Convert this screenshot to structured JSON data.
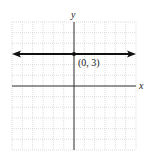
{
  "chart_data": {
    "type": "line",
    "title": "",
    "xlabel": "x",
    "ylabel": "y",
    "xlim": [
      -6,
      6
    ],
    "ylim": [
      -6,
      6
    ],
    "grid": true,
    "grid_step": 1,
    "series": [
      {
        "name": "y = 3",
        "kind": "horizontal-line",
        "x": [
          -6,
          6
        ],
        "y": [
          3,
          3
        ],
        "arrows": "both"
      }
    ],
    "points": [
      {
        "x": 0,
        "y": 3,
        "label": "(0, 3)"
      }
    ],
    "annotations": [
      "(0, 3)"
    ]
  },
  "labels": {
    "x_axis": "x",
    "y_axis": "y",
    "point": "(0, 3)"
  },
  "colors": {
    "grid": "#c8c8c8",
    "axis": "#333333",
    "line": "#111111",
    "background": "#ffffff"
  }
}
